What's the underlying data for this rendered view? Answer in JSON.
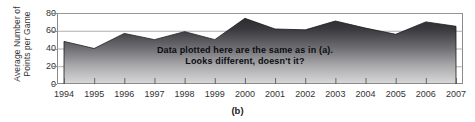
{
  "figure": {
    "caption": "(b)",
    "annotation_line1": "Data plotted here are the same as in (a).",
    "annotation_line2": "Looks different, doesn't it?"
  },
  "chart_data": {
    "type": "area",
    "title": "",
    "xlabel": "",
    "ylabel": "Average Number of Points per Game",
    "categories": [
      "1994",
      "1995",
      "1996",
      "1997",
      "1998",
      "1999",
      "2000",
      "2001",
      "2002",
      "2003",
      "2004",
      "2005",
      "2006",
      "2007"
    ],
    "values": [
      48,
      40,
      57,
      50,
      59,
      50,
      74,
      62,
      61,
      71,
      63,
      56,
      70,
      65
    ],
    "ylim": [
      0,
      80
    ],
    "yticks": [
      0,
      20,
      40,
      60,
      80
    ],
    "ytick_labels": [
      "0",
      "20",
      "40",
      "60",
      "80"
    ],
    "grid": true,
    "legend": "none",
    "fill_top_color": "#2b2b2f",
    "fill_bottom_color": "#d8d8d8",
    "axis_color": "#8a8a8a"
  }
}
